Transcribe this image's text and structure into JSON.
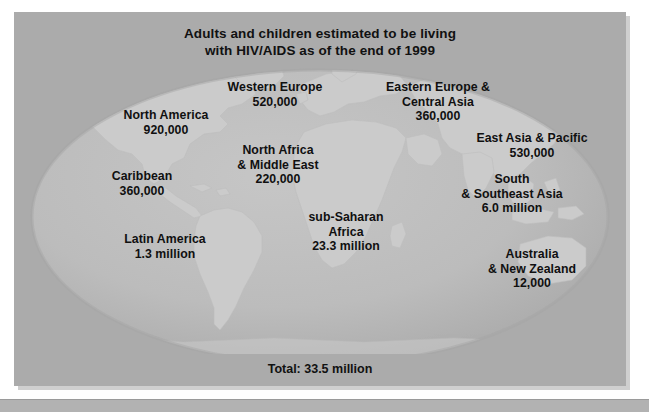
{
  "figure": {
    "title_line1": "Adults and children estimated to be living",
    "title_line2": "with HIV/AIDS as of the end of 1999",
    "total": "Total: 33.5 million",
    "colors": {
      "panel_background": "#ababab",
      "ocean": "#bdbdbd",
      "land": "#c9c9c9",
      "text": "#101010",
      "page_background": "#ffffff"
    }
  },
  "chart_data": {
    "type": "map",
    "title": "Adults and children estimated to be living with HIV/AIDS as of the end of 1999",
    "unit": "people living with HIV/AIDS",
    "categories": [
      "North America",
      "Caribbean",
      "Latin America",
      "Western Europe",
      "North Africa & Middle East",
      "sub-Saharan Africa",
      "Eastern Europe & Central Asia",
      "East Asia & Pacific",
      "South & Southeast Asia",
      "Australia & New Zealand"
    ],
    "values": [
      920000,
      360000,
      1300000,
      520000,
      220000,
      23300000,
      360000,
      530000,
      6000000,
      12000
    ],
    "total": 33500000,
    "total_label": "Total: 33.5 million",
    "legend": "none",
    "grid": false
  },
  "regions": [
    {
      "id": "north-america",
      "name_lines": [
        "North America"
      ],
      "value": "920,000",
      "x": 152,
      "y": 96
    },
    {
      "id": "western-europe",
      "name_lines": [
        "Western Europe"
      ],
      "value": "520,000",
      "x": 261,
      "y": 68
    },
    {
      "id": "eastern-europe-central-asia",
      "name_lines": [
        "Eastern Europe &",
        "Central Asia"
      ],
      "value": "360,000",
      "x": 424,
      "y": 68
    },
    {
      "id": "east-asia-pacific",
      "name_lines": [
        "East Asia & Pacific"
      ],
      "value": "530,000",
      "x": 518,
      "y": 119
    },
    {
      "id": "caribbean",
      "name_lines": [
        "Caribbean"
      ],
      "value": "360,000",
      "x": 128,
      "y": 157
    },
    {
      "id": "north-africa-middle-east",
      "name_lines": [
        "North Africa",
        "& Middle East"
      ],
      "value": "220,000",
      "x": 264,
      "y": 131
    },
    {
      "id": "south-southeast-asia",
      "name_lines": [
        "South",
        "& Southeast Asia"
      ],
      "value": "6.0 million",
      "x": 498,
      "y": 160
    },
    {
      "id": "latin-america",
      "name_lines": [
        "Latin America"
      ],
      "value": "1.3 million",
      "x": 151,
      "y": 220
    },
    {
      "id": "sub-saharan-africa",
      "name_lines": [
        "sub-Saharan",
        "Africa"
      ],
      "value": "23.3 million",
      "x": 332,
      "y": 198
    },
    {
      "id": "australia-new-zealand",
      "name_lines": [
        "Australia",
        "& New Zealand"
      ],
      "value": "12,000",
      "x": 518,
      "y": 235
    }
  ]
}
